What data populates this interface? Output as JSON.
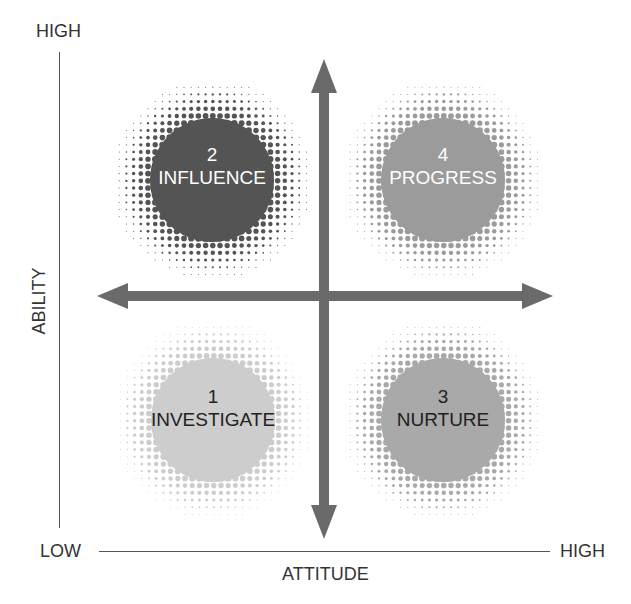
{
  "diagram": {
    "type": "quadrant-matrix",
    "y_axis": {
      "label": "ABILITY",
      "high_label": "HIGH"
    },
    "x_axis": {
      "label": "ATTITUDE",
      "low_label": "LOW",
      "high_label": "HIGH"
    },
    "quadrants": [
      {
        "id": "q2",
        "position": "top-left",
        "number": "2",
        "name": "INFLUENCE",
        "core_color": "#545454",
        "text_color": "#ffffff",
        "cx": 212,
        "cy": 180
      },
      {
        "id": "q4",
        "position": "top-right",
        "number": "4",
        "name": "PROGRESS",
        "core_color": "#9b9b9b",
        "text_color": "#ffffff",
        "cx": 443,
        "cy": 180
      },
      {
        "id": "q1",
        "position": "bottom-left",
        "number": "1",
        "name": "INVESTIGATE",
        "core_color": "#cdcdcd",
        "text_color": "#222222",
        "cx": 213,
        "cy": 420
      },
      {
        "id": "q3",
        "position": "bottom-right",
        "number": "3",
        "name": "NURTURE",
        "core_color": "#a9a9a9",
        "text_color": "#222222",
        "cx": 443,
        "cy": 420
      }
    ],
    "arrow_color": "#6a6a6a",
    "axis_line_color": "#555555"
  }
}
